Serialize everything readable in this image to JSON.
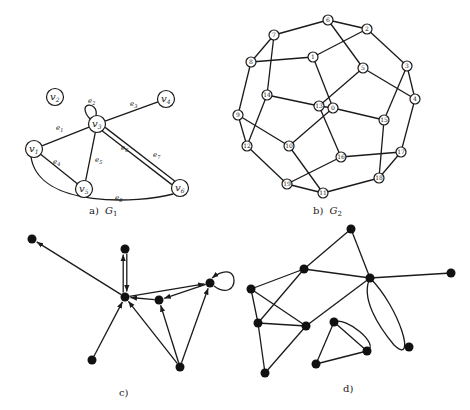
{
  "figure": {
    "panels": [
      {
        "id": "a",
        "caption": "a) G₁",
        "caption_prefix": "a)",
        "caption_graph": "G",
        "caption_sub": "1",
        "type": "undirected-multigraph-labeled",
        "vertices": [
          {
            "id": "v1",
            "label": "v",
            "sub": "1",
            "x": 34,
            "y": 149
          },
          {
            "id": "v2",
            "label": "v",
            "sub": "2",
            "x": 55,
            "y": 97
          },
          {
            "id": "v3",
            "label": "v",
            "sub": "3",
            "x": 97,
            "y": 124
          },
          {
            "id": "v4",
            "label": "v",
            "sub": "4",
            "x": 166,
            "y": 99
          },
          {
            "id": "v5",
            "label": "v",
            "sub": "5",
            "x": 84,
            "y": 189
          },
          {
            "id": "v6",
            "label": "v",
            "sub": "6",
            "x": 180,
            "y": 188
          }
        ],
        "edges": [
          {
            "id": "e1",
            "label": "e",
            "sub": "1",
            "from": "v1",
            "to": "v3",
            "lx": 56,
            "ly": 130
          },
          {
            "id": "e2",
            "label": "e",
            "sub": "2",
            "from": "v3",
            "to": "v3",
            "loop": true,
            "lx": 88,
            "ly": 103
          },
          {
            "id": "e3",
            "label": "e",
            "sub": "3",
            "from": "v3",
            "to": "v4",
            "lx": 130,
            "ly": 106
          },
          {
            "id": "e4",
            "label": "e",
            "sub": "4",
            "from": "v1",
            "to": "v5",
            "lx": 53,
            "ly": 164
          },
          {
            "id": "e5",
            "label": "e",
            "sub": "5",
            "from": "v3",
            "to": "v5",
            "lx": 95,
            "ly": 162
          },
          {
            "id": "e6",
            "label": "e",
            "sub": "6",
            "from": "v3",
            "to": "v6",
            "lx": 121,
            "ly": 150
          },
          {
            "id": "e7",
            "label": "e",
            "sub": "7",
            "from": "v3",
            "to": "v6",
            "lx": 153,
            "ly": 157
          },
          {
            "id": "e8",
            "label": "e",
            "sub": "8",
            "from": "v1",
            "to": "v6",
            "curved": true,
            "lx": 115,
            "ly": 200
          }
        ]
      },
      {
        "id": "b",
        "caption": "b) G₂",
        "caption_prefix": "b)",
        "caption_graph": "G",
        "caption_sub": "2",
        "type": "undirected-numbered",
        "label_confidence_note": "Labels marked uncertain are guessed, not read from the image (blurred two-digit numbers).",
        "vertices": [
          {
            "id": "n6",
            "label": "6",
            "x": 328,
            "y": 20,
            "uncertain": false
          },
          {
            "id": "n2",
            "label": "2",
            "x": 367,
            "y": 29,
            "uncertain": false
          },
          {
            "id": "n7",
            "label": "7",
            "x": 274,
            "y": 35,
            "uncertain": false
          },
          {
            "id": "n1",
            "label": "1",
            "x": 313,
            "y": 57,
            "uncertain": false
          },
          {
            "id": "n8",
            "label": "8",
            "x": 251,
            "y": 62,
            "uncertain": false
          },
          {
            "id": "n5",
            "label": "5",
            "x": 363,
            "y": 68,
            "uncertain": false
          },
          {
            "id": "n3",
            "label": "3",
            "x": 407,
            "y": 66,
            "uncertain": false
          },
          {
            "id": "n4",
            "label": "4",
            "x": 415,
            "y": 99,
            "uncertain": false
          },
          {
            "id": "n14",
            "label": "14",
            "x": 267,
            "y": 95,
            "uncertain": true
          },
          {
            "id": "n13",
            "label": "13",
            "x": 319,
            "y": 106,
            "uncertain": true
          },
          {
            "id": "n0",
            "label": "0",
            "x": 333,
            "y": 108,
            "uncertain": false
          },
          {
            "id": "n9",
            "label": "9",
            "x": 238,
            "y": 115,
            "uncertain": false
          },
          {
            "id": "n15",
            "label": "15",
            "x": 384,
            "y": 120,
            "uncertain": true
          },
          {
            "id": "n10",
            "label": "10",
            "x": 289,
            "y": 146,
            "uncertain": true
          },
          {
            "id": "n16",
            "label": "16",
            "x": 341,
            "y": 157,
            "uncertain": true
          },
          {
            "id": "n17",
            "label": "17",
            "x": 401,
            "y": 152,
            "uncertain": true
          },
          {
            "id": "n12",
            "label": "12",
            "x": 247,
            "y": 146,
            "uncertain": true
          },
          {
            "id": "n18",
            "label": "18",
            "x": 379,
            "y": 178,
            "uncertain": true
          },
          {
            "id": "n19",
            "label": "19",
            "x": 287,
            "y": 184,
            "uncertain": true
          },
          {
            "id": "n11",
            "label": "11",
            "x": 323,
            "y": 193,
            "uncertain": true
          }
        ],
        "edges": [
          [
            "n6",
            "n2"
          ],
          [
            "n6",
            "n7"
          ],
          [
            "n6",
            "n5"
          ],
          [
            "n2",
            "n1"
          ],
          [
            "n2",
            "n3"
          ],
          [
            "n7",
            "n8"
          ],
          [
            "n7",
            "n14"
          ],
          [
            "n8",
            "n1"
          ],
          [
            "n8",
            "n9"
          ],
          [
            "n1",
            "n0"
          ],
          [
            "n5",
            "n13"
          ],
          [
            "n5",
            "n4"
          ],
          [
            "n3",
            "n4"
          ],
          [
            "n3",
            "n15"
          ],
          [
            "n4",
            "n17"
          ],
          [
            "n14",
            "n13"
          ],
          [
            "n14",
            "n12"
          ],
          [
            "n13",
            "n16"
          ],
          [
            "n13",
            "n0"
          ],
          [
            "n0",
            "n15"
          ],
          [
            "n0",
            "n10"
          ],
          [
            "n9",
            "n10"
          ],
          [
            "n9",
            "n12"
          ],
          [
            "n12",
            "n19"
          ],
          [
            "n10",
            "n11"
          ],
          [
            "n15",
            "n18"
          ],
          [
            "n16",
            "n17"
          ],
          [
            "n16",
            "n19"
          ],
          [
            "n17",
            "n18"
          ],
          [
            "n19",
            "n11"
          ],
          [
            "n11",
            "n18"
          ]
        ]
      },
      {
        "id": "c",
        "caption": "c)",
        "type": "directed",
        "vertices": [
          {
            "id": "c1",
            "x": 32,
            "y": 239
          },
          {
            "id": "c2",
            "x": 125,
            "y": 249
          },
          {
            "id": "c3",
            "x": 125,
            "y": 297
          },
          {
            "id": "c4",
            "x": 159,
            "y": 300
          },
          {
            "id": "c5",
            "x": 210,
            "y": 283
          },
          {
            "id": "c6",
            "x": 92,
            "y": 360
          },
          {
            "id": "c7",
            "x": 180,
            "y": 367
          }
        ],
        "edges": [
          {
            "from": "c3",
            "to": "c1"
          },
          {
            "from": "c3",
            "to": "c2"
          },
          {
            "from": "c2",
            "to": "c3"
          },
          {
            "from": "c3",
            "to": "c5"
          },
          {
            "from": "c5",
            "to": "c4"
          },
          {
            "from": "c4",
            "to": "c3"
          },
          {
            "from": "c5",
            "to": "c5",
            "loop": true
          },
          {
            "from": "c6",
            "to": "c3"
          },
          {
            "from": "c7",
            "to": "c3"
          },
          {
            "from": "c7",
            "to": "c4"
          },
          {
            "from": "c7",
            "to": "c5"
          }
        ]
      },
      {
        "id": "d",
        "caption": "d)",
        "type": "undirected-multigraph",
        "vertices": [
          {
            "id": "d1",
            "x": 351,
            "y": 229
          },
          {
            "id": "d2",
            "x": 304,
            "y": 269
          },
          {
            "id": "d3",
            "x": 370,
            "y": 278
          },
          {
            "id": "d4",
            "x": 451,
            "y": 273
          },
          {
            "id": "d5",
            "x": 251,
            "y": 289
          },
          {
            "id": "d6",
            "x": 258,
            "y": 323
          },
          {
            "id": "d7",
            "x": 306,
            "y": 326
          },
          {
            "id": "d8",
            "x": 334,
            "y": 322
          },
          {
            "id": "d9",
            "x": 367,
            "y": 351
          },
          {
            "id": "d10",
            "x": 409,
            "y": 347
          },
          {
            "id": "d11",
            "x": 316,
            "y": 364
          },
          {
            "id": "d12",
            "x": 265,
            "y": 373
          }
        ],
        "edges": [
          {
            "from": "d1",
            "to": "d2"
          },
          {
            "from": "d1",
            "to": "d3"
          },
          {
            "from": "d2",
            "to": "d3"
          },
          {
            "from": "d2",
            "to": "d5"
          },
          {
            "from": "d2",
            "to": "d6"
          },
          {
            "from": "d3",
            "to": "d4"
          },
          {
            "from": "d3",
            "to": "d7"
          },
          {
            "from": "d3",
            "to": "d10",
            "ellipse": true
          },
          {
            "from": "d5",
            "to": "d6"
          },
          {
            "from": "d5",
            "to": "d7"
          },
          {
            "from": "d6",
            "to": "d7"
          },
          {
            "from": "d6",
            "to": "d12"
          },
          {
            "from": "d7",
            "to": "d12"
          },
          {
            "from": "d8",
            "to": "d9"
          },
          {
            "from": "d8",
            "to": "d9",
            "curved": true
          },
          {
            "from": "d8",
            "to": "d11"
          },
          {
            "from": "d11",
            "to": "d9"
          }
        ]
      }
    ]
  }
}
